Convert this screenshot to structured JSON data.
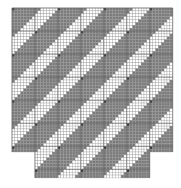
{
  "diagram": {
    "type": "weave-draft",
    "colors": {
      "background": "#ffffff",
      "filled": "#7a7a7a",
      "empty": "#ffffff",
      "accent": "#3c3c3c",
      "gridline": "#9a9a9a",
      "major_gridline": "#555555"
    },
    "grid": {
      "origin_x": 12,
      "origin_y": 8,
      "cell_w": 2.87,
      "cell_h": 2.88,
      "cols": 56,
      "rows": 59,
      "major_every": 8,
      "period": 16,
      "filled_run": 10,
      "shift_per_row": 1
    },
    "shape": [
      {
        "col_start": 0,
        "col_end": 56,
        "row_start": 0,
        "row_end": 50
      },
      {
        "col_start": 8,
        "col_end": 48,
        "row_start": 50,
        "row_end": 59
      }
    ]
  }
}
